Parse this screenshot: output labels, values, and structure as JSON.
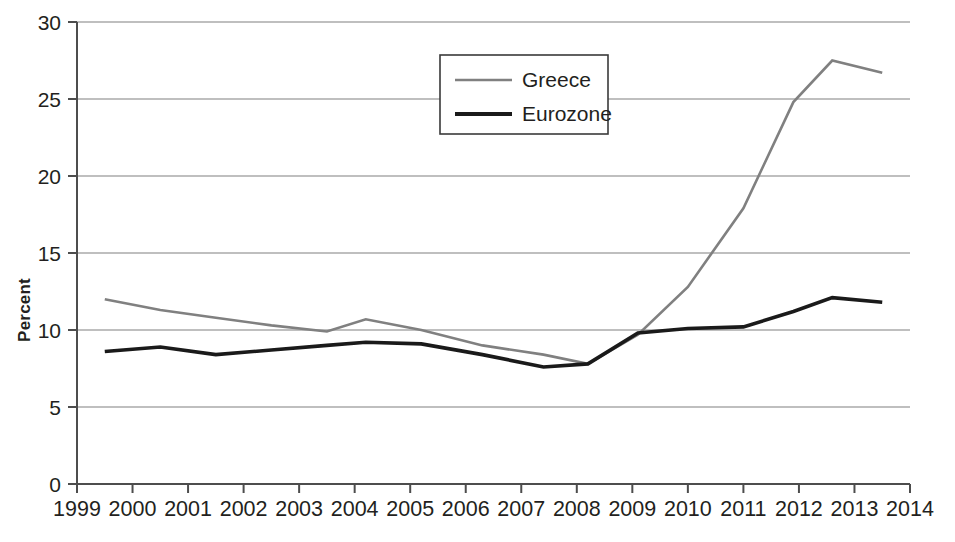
{
  "chart_data": {
    "type": "line",
    "title": "",
    "subtitle": "",
    "xlabel": "",
    "ylabel": "Percent",
    "xlim": [
      1999,
      2014
    ],
    "ylim": [
      0,
      30
    ],
    "grid": true,
    "legend_position": "top-center",
    "x_ticks": [
      "1999",
      "2000",
      "2001",
      "2002",
      "2003",
      "2004",
      "2005",
      "2006",
      "2007",
      "2008",
      "2009",
      "2010",
      "2011",
      "2012",
      "2013",
      "2014"
    ],
    "y_ticks": [
      "0",
      "5",
      "10",
      "15",
      "20",
      "25",
      "30"
    ],
    "x": [
      1999.5,
      2000.5,
      2001.5,
      2002.5,
      2003.5,
      2004.2,
      2005.2,
      2006.3,
      2007.4,
      2008.2,
      2009.1,
      2010.0,
      2011.0,
      2011.9,
      2012.6,
      2013.5
    ],
    "series": [
      {
        "name": "Greece",
        "color": "#808080",
        "width": 2.6,
        "values": [
          12.0,
          11.3,
          10.8,
          10.3,
          9.9,
          10.7,
          10.0,
          9.0,
          8.4,
          7.8,
          9.7,
          12.8,
          17.9,
          24.8,
          27.5,
          26.7
        ]
      },
      {
        "name": "Eurozone",
        "color": "#1a1a1a",
        "width": 3.6,
        "values": [
          8.6,
          8.9,
          8.4,
          8.7,
          9.0,
          9.2,
          9.1,
          8.4,
          7.6,
          7.8,
          9.8,
          10.1,
          10.2,
          11.2,
          12.1,
          11.8
        ]
      }
    ]
  },
  "legend": {
    "entries": [
      {
        "label": "Greece"
      },
      {
        "label": "Eurozone"
      }
    ]
  },
  "axes": {
    "y_title": "Percent"
  }
}
